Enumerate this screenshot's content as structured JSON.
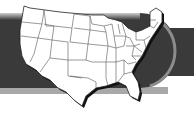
{
  "graphic": {
    "subject": "United States map with state outlines",
    "colors": {
      "background": "#ffffff",
      "band": "#3a3a3a",
      "band_top_highlight": "#9a9a9a",
      "band_bottom_strip": "#a8a8a8",
      "rim": "#8c8c8c",
      "map_fill": "#ffffff",
      "state_lines": "#555555",
      "map_shadow": "#111111"
    }
  }
}
